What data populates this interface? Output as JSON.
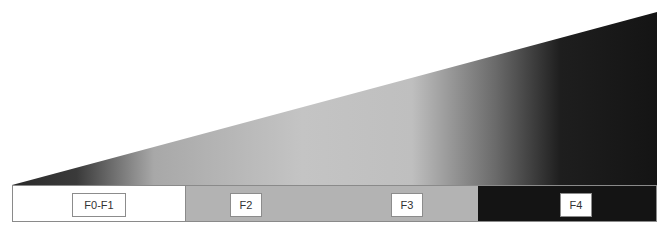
{
  "diagram": {
    "wedge": {
      "description": "fibrosis severity gradient wedge",
      "gradient_stops": [
        {
          "offset": "0%",
          "color": "#2a2a2a"
        },
        {
          "offset": "10%",
          "color": "#3a3a3a"
        },
        {
          "offset": "22%",
          "color": "#a8a8a8"
        },
        {
          "offset": "45%",
          "color": "#c4c4c4"
        },
        {
          "offset": "62%",
          "color": "#bfbfbf"
        },
        {
          "offset": "75%",
          "color": "#6a6a6a"
        },
        {
          "offset": "85%",
          "color": "#1e1e1e"
        },
        {
          "offset": "100%",
          "color": "#141414"
        }
      ]
    },
    "stages": [
      {
        "label": "F0-F1",
        "color": "#ffffff"
      },
      {
        "label": "F2",
        "color": "#b3b3b3"
      },
      {
        "label": "F3",
        "color": "#b3b3b3"
      },
      {
        "label": "F4",
        "color": "#141414"
      }
    ]
  }
}
